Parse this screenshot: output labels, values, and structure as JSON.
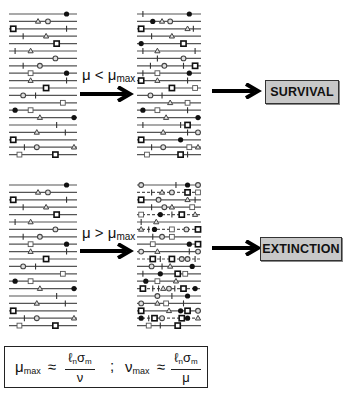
{
  "diagram": {
    "conditions": {
      "top": {
        "mu": "μ",
        "op": "<",
        "mu2": "μ",
        "sub": "max"
      },
      "bottom": {
        "mu": "μ",
        "op": ">",
        "mu2": "μ",
        "sub": "max"
      }
    },
    "outcomes": {
      "top": "SURVIVAL",
      "bottom": "EXTINCTION"
    },
    "formula": {
      "lhs1_symbol": "μ",
      "lhs1_sub": "max",
      "approx1": "≈",
      "num1_l": "ℓ",
      "num1_lsub": "n",
      "num1_s": "σ",
      "num1_ssub": "m",
      "den1": "ν",
      "separator": ";",
      "lhs2_symbol": "ν",
      "lhs2_sub": "max",
      "approx2": "≈",
      "num2_l": "ℓ",
      "num2_lsub": "n",
      "num2_s": "σ",
      "num2_ssub": "m",
      "den2": "μ"
    },
    "marker_legend": [
      "filled-circle",
      "open-circle",
      "triangle",
      "square",
      "tick"
    ],
    "colors": {
      "line": "#555555",
      "marker_fill_dark": "#111111",
      "outcome_bg": "#c8c8c8",
      "arrow": "#000000"
    },
    "bundles": {
      "top_left": [
        [
          [
            "F",
            0.88
          ]
        ],
        [
          [
            "T",
            0.42
          ],
          [
            "O",
            0.58
          ]
        ],
        [
          [
            "S",
            0.02
          ],
          [
            "K",
            0.88
          ]
        ],
        [
          [
            "K",
            0.18
          ],
          [
            "T",
            0.55
          ]
        ],
        [
          [
            "S",
            0.72
          ]
        ],
        [
          [
            "K",
            0.05
          ],
          [
            "T",
            0.3
          ]
        ],
        [
          [
            "O",
            0.7
          ]
        ],
        [
          [
            "K",
            0.18
          ],
          [
            "O",
            0.45
          ]
        ],
        [
          [
            "s",
            0.3
          ],
          [
            "F",
            0.88
          ]
        ],
        [
          [
            "T",
            0.3
          ],
          [
            "K",
            0.88
          ]
        ],
        [
          [
            "S",
            0.55
          ]
        ],
        [
          [
            "O",
            0.18
          ],
          [
            "K",
            0.38
          ]
        ],
        [
          [
            "s",
            0.82
          ]
        ],
        [
          [
            "F",
            0.05
          ],
          [
            "s",
            0.3
          ]
        ],
        [
          [
            "T",
            0.45
          ],
          [
            "F",
            1.0
          ]
        ],
        [
          [
            "K",
            0.72
          ]
        ],
        [
          [
            "T",
            0.4
          ],
          [
            "K",
            0.86
          ]
        ],
        [
          [
            "S",
            0.02
          ]
        ],
        [
          [
            "K",
            0.2
          ],
          [
            "O",
            0.4
          ],
          [
            "T",
            1.0
          ]
        ],
        [
          [
            "s",
            0.12
          ],
          [
            "S",
            0.7
          ]
        ]
      ],
      "top_middle": [
        [
          [
            "K",
            0.05
          ],
          [
            "F",
            0.85
          ]
        ],
        [
          [
            "F",
            0.22
          ],
          [
            "T",
            0.38
          ],
          [
            "O",
            0.52
          ]
        ],
        [
          [
            "S",
            0.02
          ],
          [
            "T",
            0.82
          ],
          [
            "K",
            0.92
          ]
        ],
        [
          [
            "K",
            0.2
          ],
          [
            "T",
            0.55
          ]
        ],
        [
          [
            "F",
            0.02
          ],
          [
            "S",
            0.75
          ]
        ],
        [
          [
            "K",
            0.05
          ],
          [
            "T",
            0.3
          ],
          [
            "K",
            0.95
          ]
        ],
        [
          [
            "K",
            0.3
          ],
          [
            "O",
            0.75
          ]
        ],
        [
          [
            "K",
            0.18
          ],
          [
            "O",
            0.42
          ],
          [
            "K",
            0.75
          ],
          [
            "S",
            0.95
          ]
        ],
        [
          [
            "K",
            0.05
          ],
          [
            "s",
            0.3
          ],
          [
            "F",
            0.85
          ]
        ],
        [
          [
            "S",
            0.02
          ],
          [
            "T",
            0.3
          ],
          [
            "K",
            0.82
          ]
        ],
        [
          [
            "S",
            0.55
          ],
          [
            "s",
            0.95
          ]
        ],
        [
          [
            "O",
            0.18
          ],
          [
            "K",
            0.38
          ]
        ],
        [
          [
            "T",
            0.52
          ],
          [
            "s",
            0.82
          ]
        ],
        [
          [
            "F",
            0.05
          ],
          [
            "s",
            0.3
          ],
          [
            "K",
            0.82
          ]
        ],
        [
          [
            "T",
            0.45
          ],
          [
            "F",
            1.0
          ]
        ],
        [
          [
            "K",
            0.05
          ],
          [
            "K",
            0.7
          ],
          [
            "S",
            0.82
          ]
        ],
        [
          [
            "T",
            0.4
          ],
          [
            "K",
            0.82
          ],
          [
            "O",
            1.0
          ]
        ],
        [
          [
            "S",
            0.02
          ],
          [
            "F",
            0.7
          ]
        ],
        [
          [
            "K",
            0.2
          ],
          [
            "O",
            0.4
          ],
          [
            "s",
            0.85
          ],
          [
            "T",
            1.0
          ]
        ],
        [
          [
            "s",
            0.12
          ],
          [
            "S",
            0.7
          ],
          [
            "K",
            0.82
          ]
        ]
      ],
      "bottom_left": [
        [
          [
            "F",
            0.88
          ]
        ],
        [
          [
            "T",
            0.42
          ],
          [
            "O",
            0.58
          ]
        ],
        [
          [
            "S",
            0.02
          ],
          [
            "K",
            0.88
          ]
        ],
        [
          [
            "K",
            0.18
          ],
          [
            "T",
            0.55
          ]
        ],
        [
          [
            "S",
            0.72
          ]
        ],
        [
          [
            "K",
            0.05
          ],
          [
            "T",
            0.3
          ]
        ],
        [
          [
            "O",
            0.7
          ]
        ],
        [
          [
            "K",
            0.18
          ],
          [
            "O",
            0.45
          ]
        ],
        [
          [
            "s",
            0.3
          ],
          [
            "F",
            0.88
          ]
        ],
        [
          [
            "T",
            0.3
          ],
          [
            "K",
            0.88
          ]
        ],
        [
          [
            "S",
            0.55
          ]
        ],
        [
          [
            "O",
            0.18
          ],
          [
            "K",
            0.38
          ]
        ],
        [
          [
            "s",
            0.82
          ]
        ],
        [
          [
            "F",
            0.05
          ],
          [
            "s",
            0.3
          ]
        ],
        [
          [
            "T",
            0.45
          ],
          [
            "F",
            1.0
          ]
        ],
        [
          [
            "K",
            0.72
          ]
        ],
        [
          [
            "T",
            0.4
          ],
          [
            "K",
            0.86
          ]
        ],
        [
          [
            "S",
            0.02
          ]
        ],
        [
          [
            "K",
            0.2
          ],
          [
            "O",
            0.4
          ],
          [
            "T",
            1.0
          ]
        ],
        [
          [
            "s",
            0.12
          ],
          [
            "S",
            0.7
          ]
        ]
      ],
      "bottom_middle": [
        [
          [
            "O",
            0.02
          ],
          [
            "K",
            0.62
          ],
          [
            "F",
            0.82
          ],
          [
            "O",
            1.0
          ]
        ],
        [
          [
            "K",
            0.2
          ],
          [
            "T",
            0.38
          ],
          [
            "O",
            0.55
          ],
          [
            "S",
            0.82
          ],
          [
            "s",
            1.0
          ]
        ],
        [
          [
            "S",
            0.02
          ],
          [
            "O",
            0.32
          ],
          [
            "T",
            0.82
          ],
          [
            "K",
            0.95
          ]
        ],
        [
          [
            "K",
            0.2
          ],
          [
            "O",
            0.42
          ],
          [
            "T",
            0.55
          ],
          [
            "s",
            0.9
          ]
        ],
        [
          [
            "s",
            0.02
          ],
          [
            "F",
            0.35
          ],
          [
            "K",
            0.55
          ],
          [
            "S",
            0.72
          ],
          [
            "T",
            0.95
          ]
        ],
        [
          [
            "K",
            0.02
          ],
          [
            "T",
            0.28
          ]
        ],
        [
          [
            "T",
            0.02
          ],
          [
            "K",
            0.15
          ],
          [
            "F",
            0.25
          ],
          [
            "s",
            0.55
          ],
          [
            "O",
            0.8
          ],
          [
            "S",
            1.0
          ]
        ],
        [
          [
            "K",
            0.22
          ],
          [
            "O",
            0.38
          ],
          [
            "s",
            0.55
          ]
        ],
        [
          [
            "s",
            0.22
          ],
          [
            "F",
            0.85
          ],
          [
            "S",
            1.0
          ]
        ],
        [
          [
            "O",
            0.02
          ],
          [
            "T",
            0.3
          ],
          [
            "K",
            0.85
          ],
          [
            "O",
            1.0
          ]
        ],
        [
          [
            "S",
            0.22
          ],
          [
            "K",
            0.35
          ],
          [
            "S",
            0.55
          ],
          [
            "O",
            0.72
          ],
          [
            "O",
            0.82
          ],
          [
            "K",
            0.95
          ]
        ],
        [
          [
            "O",
            0.2
          ],
          [
            "K",
            0.38
          ],
          [
            "T",
            0.52
          ],
          [
            "F",
            0.9
          ]
        ],
        [
          [
            "K",
            0.05
          ],
          [
            "F",
            0.35
          ],
          [
            "S",
            0.65
          ],
          [
            "s",
            0.78
          ]
        ],
        [
          [
            "F",
            0.1
          ],
          [
            "s",
            0.3
          ],
          [
            "T",
            0.62
          ]
        ],
        [
          [
            "S",
            0.05
          ],
          [
            "K",
            0.22
          ],
          [
            "K",
            0.32
          ],
          [
            "T",
            0.4
          ],
          [
            "O",
            0.5
          ],
          [
            "K",
            0.6
          ],
          [
            "S",
            0.75
          ],
          [
            "F",
            0.95
          ]
        ],
        [
          [
            "O",
            0.3
          ],
          [
            "K",
            0.55
          ],
          [
            "F",
            0.82
          ]
        ],
        [
          [
            "O",
            0.02
          ],
          [
            "T",
            0.3
          ],
          [
            "s",
            0.45
          ],
          [
            "K",
            0.75
          ]
        ],
        [
          [
            "S",
            0.02
          ],
          [
            "T",
            0.5
          ],
          [
            "F",
            0.7
          ],
          [
            "S",
            0.82
          ],
          [
            "O",
            1.0
          ]
        ],
        [
          [
            "F",
            0.02
          ],
          [
            "K",
            0.15
          ],
          [
            "S",
            0.25
          ],
          [
            "O",
            0.38
          ],
          [
            "S",
            0.72
          ],
          [
            "F",
            0.82
          ],
          [
            "T",
            1.0
          ]
        ],
        [
          [
            "s",
            0.15
          ],
          [
            "K",
            0.35
          ],
          [
            "S",
            0.65
          ]
        ]
      ]
    },
    "dashed_rows_bottom_middle": [
      1,
      4,
      6,
      10,
      14,
      18
    ]
  }
}
